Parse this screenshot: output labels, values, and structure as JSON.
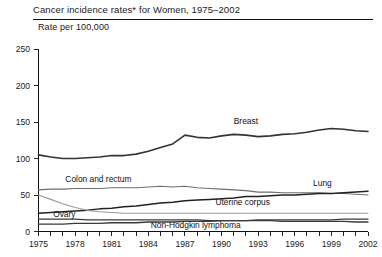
{
  "header": {
    "title": "Cancer incidence rates* for Women, 1975–2002",
    "axis_title": "Rate per 100,000"
  },
  "chart_data": {
    "type": "line",
    "title": "Cancer incidence rates* for Women, 1975–2002",
    "subtitle": "Rate per 100,000",
    "xlabel": "",
    "ylabel": "Rate per 100,000",
    "xlim": [
      1975,
      2002
    ],
    "ylim": [
      0,
      250
    ],
    "yticks": [
      0,
      50,
      100,
      150,
      200,
      250
    ],
    "ytick_labels": [
      "0",
      "50",
      "100",
      "150",
      "200",
      "250"
    ],
    "xticks": [
      1975,
      1976,
      1977,
      1978,
      1979,
      1980,
      1981,
      1982,
      1983,
      1984,
      1985,
      1986,
      1987,
      1988,
      1989,
      1990,
      1991,
      1992,
      1993,
      1994,
      1995,
      1996,
      1997,
      1998,
      1999,
      2000,
      2001,
      2002
    ],
    "xtick_labels_shown": [
      "1975",
      "1978",
      "1981",
      "1984",
      "1987",
      "1990",
      "1993",
      "1996",
      "1999",
      "2002"
    ],
    "xtick_label_years": [
      1975,
      1978,
      1981,
      1984,
      1987,
      1990,
      1993,
      1996,
      1999,
      2002
    ],
    "grid": false,
    "legend_position": "inline-annotations",
    "x": [
      1975,
      1976,
      1977,
      1978,
      1979,
      1980,
      1981,
      1982,
      1983,
      1984,
      1985,
      1986,
      1987,
      1988,
      1989,
      1990,
      1991,
      1992,
      1993,
      1994,
      1995,
      1996,
      1997,
      1998,
      1999,
      2000,
      2001,
      2002
    ],
    "series": [
      {
        "name": "Breast",
        "color": "#333333",
        "width": 1.6,
        "label_x": 1991,
        "label_y": 152,
        "values": [
          105,
          102,
          100,
          100,
          101,
          102,
          104,
          104,
          106,
          110,
          115,
          120,
          132,
          129,
          128,
          131,
          133,
          132,
          130,
          131,
          133,
          134,
          136,
          139,
          141,
          140,
          138,
          137
        ]
      },
      {
        "name": "Colon and rectum",
        "color": "#6e6e6e",
        "width": 1.1,
        "label_x": 1977.2,
        "label_y": 72,
        "values": [
          57,
          58,
          58,
          59,
          59,
          59,
          60,
          60,
          60,
          61,
          62,
          61,
          62,
          60,
          59,
          58,
          57,
          56,
          54,
          54,
          53,
          53,
          53,
          53,
          52,
          52,
          51,
          50
        ]
      },
      {
        "name": "Lung",
        "color": "#222222",
        "width": 1.5,
        "label_x": 1997.5,
        "label_y": 66,
        "values": [
          25,
          26,
          27,
          28,
          29,
          31,
          32,
          34,
          35,
          37,
          39,
          40,
          42,
          43,
          44,
          45,
          46,
          48,
          48,
          49,
          50,
          50,
          51,
          52,
          52,
          53,
          54,
          55
        ]
      },
      {
        "name": "Uterine corpus",
        "color": "#9a9a9a",
        "width": 1.1,
        "label_x": 1989.5,
        "label_y": 41,
        "values": [
          50,
          44,
          38,
          33,
          29,
          27,
          26,
          25,
          25,
          25,
          25,
          25,
          25,
          25,
          25,
          25,
          25,
          25,
          25,
          25,
          25,
          25,
          25,
          25,
          25,
          25,
          25,
          25
        ]
      },
      {
        "name": "Ovary",
        "color": "#3a3a3a",
        "width": 1.3,
        "label_x": 1976.2,
        "label_y": 24,
        "values": [
          17,
          17,
          17,
          17,
          16,
          16,
          16,
          16,
          16,
          16,
          16,
          16,
          16,
          16,
          15,
          15,
          15,
          15,
          15,
          15,
          14,
          14,
          14,
          14,
          14,
          14,
          13,
          13
        ]
      },
      {
        "name": "Non-Hodgkin lymphoma",
        "color": "#3a3a3a",
        "width": 1.3,
        "label_x": 1984.2,
        "label_y": 9,
        "values": [
          10,
          10,
          10,
          11,
          11,
          11,
          12,
          12,
          12,
          13,
          13,
          13,
          14,
          14,
          14,
          15,
          15,
          15,
          16,
          16,
          16,
          16,
          16,
          16,
          16,
          17,
          17,
          17
        ]
      }
    ]
  }
}
